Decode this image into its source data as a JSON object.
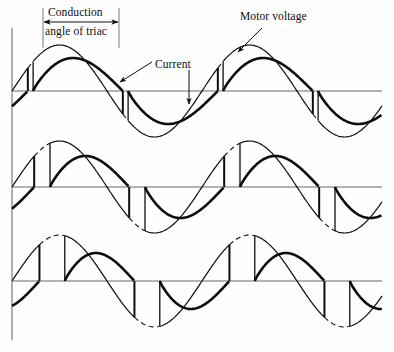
{
  "figure": {
    "background_color": "#fefefe",
    "ink_color": "#0d0d0d",
    "axis_color": "#6b6b6b",
    "width": 394,
    "height": 352,
    "labels": {
      "conduction_line1": "Conduction",
      "conduction_line2": "angle of triac",
      "motor_voltage": "Motor voltage",
      "current": "Current"
    },
    "annotations": {
      "conduction_bracket": {
        "left_guide_x": 43,
        "right_guide_x": 119,
        "guide_top_y": 8,
        "guide_bottom_y": 48,
        "arrow_y": 22
      },
      "motor_voltage_leader": {
        "from_x": 262,
        "from_y": 28,
        "to_x": 238,
        "to_y": 52
      },
      "current_leader_row1": {
        "from_x": 189,
        "from_y": 70,
        "to_x": 189,
        "to_y": 104
      },
      "current_leader_conduction": {
        "from_x": 152,
        "from_y": 62,
        "to_x": 120,
        "to_y": 82
      }
    },
    "axes": {
      "vertical_axis_x": 12,
      "vertical_axis_top": 28,
      "vertical_axis_bottom": 340,
      "baseline_left_x": 12,
      "baseline_right_x": 382,
      "baselines_y": [
        91,
        187,
        281
      ]
    },
    "rows": [
      {
        "name": "row-large-conduction-angle",
        "baseline_y": 91,
        "amplitude_voltage": 46,
        "amplitude_current": 33,
        "firing_angle_deg": 40,
        "extinction_angle_deg": 210,
        "conduction_angle_deg": 170,
        "phase_lag_deg": 38
      },
      {
        "name": "row-medium-conduction-angle",
        "baseline_y": 187,
        "amplitude_voltage": 46,
        "amplitude_current": 31,
        "firing_angle_deg": 72,
        "extinction_angle_deg": 222,
        "conduction_angle_deg": 150,
        "phase_lag_deg": 40
      },
      {
        "name": "row-small-conduction-angle",
        "baseline_y": 281,
        "amplitude_voltage": 46,
        "amplitude_current": 28,
        "firing_angle_deg": 100,
        "extinction_angle_deg": 232,
        "conduction_angle_deg": 132,
        "phase_lag_deg": 42
      }
    ],
    "waveform_period_px": 190,
    "waveform_start_x": 12,
    "curves": {
      "supply_blocked": {
        "style": "dashed",
        "width": 1.1,
        "meaning": "blocked portion of supply sine"
      },
      "motor_voltage": {
        "style": "solid",
        "width": 1.1,
        "meaning": "voltage applied to motor after triac fires"
      },
      "current": {
        "style": "solid",
        "width": 2.6,
        "meaning": "lagging motor current"
      }
    }
  }
}
